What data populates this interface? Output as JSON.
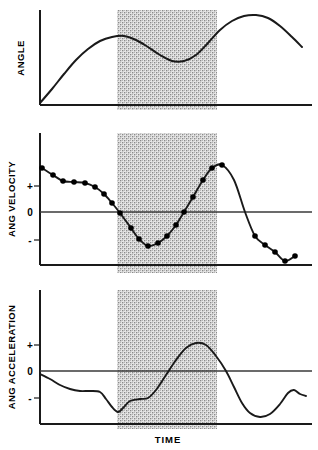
{
  "figure": {
    "title": "",
    "time_axis_label": "TIME",
    "highlight_band": {
      "name": "shaded-interval",
      "x_start": 117,
      "x_end": 217,
      "fill": "#c9c9c9"
    },
    "colors": {
      "curve": "#1a1a1a",
      "axis": "#1a1a1a",
      "marker": "#000000",
      "band": "#c9c9c9",
      "background": "#ffffff"
    }
  },
  "panels": [
    {
      "id": "angle",
      "label": "ANGLE",
      "tick_labels": [],
      "axis_x": 40,
      "axis_top": 10,
      "baseline_y": 105,
      "plot_right": 312
    },
    {
      "id": "ang-velocity",
      "label": "ANG VELOCITY",
      "tick_labels": [
        "+",
        "0",
        "-"
      ],
      "axis_x": 40,
      "axis_top": 133,
      "baseline_y": 265,
      "plot_right": 312,
      "zero_y": 212,
      "plus_y": 186,
      "minus_y": 240
    },
    {
      "id": "ang-acceleration",
      "label": "ANG ACCELERATION",
      "tick_labels": [
        "+",
        "0",
        "-"
      ],
      "axis_x": 40,
      "axis_top": 290,
      "baseline_y": 424,
      "plot_right": 312,
      "zero_y": 371,
      "plus_y": 345,
      "minus_y": 398
    }
  ],
  "chart_data": {
    "type": "line",
    "title": "",
    "xlabel": "TIME",
    "ylabel": "",
    "grid": false,
    "legend": "none",
    "shaded_region": {
      "x_start_frac": 0.283,
      "x_end_frac": 0.651
    },
    "series": [
      {
        "name": "ANGLE",
        "panel": "angle",
        "ylabel": "ANGLE",
        "ytick_labels": [],
        "markers": false,
        "points": [
          [
            40,
            103
          ],
          [
            52,
            89
          ],
          [
            64,
            74
          ],
          [
            76,
            60
          ],
          [
            88,
            49
          ],
          [
            100,
            41
          ],
          [
            112,
            37
          ],
          [
            124,
            36
          ],
          [
            136,
            40
          ],
          [
            148,
            47
          ],
          [
            160,
            55
          ],
          [
            172,
            61
          ],
          [
            184,
            61
          ],
          [
            196,
            55
          ],
          [
            208,
            43
          ],
          [
            220,
            30
          ],
          [
            232,
            21
          ],
          [
            244,
            16
          ],
          [
            256,
            15
          ],
          [
            268,
            18
          ],
          [
            280,
            26
          ],
          [
            292,
            37
          ],
          [
            302,
            47
          ]
        ]
      },
      {
        "name": "ANG VELOCITY",
        "panel": "ang-velocity",
        "ylabel": "ANG VELOCITY",
        "ytick_labels": [
          "+",
          "0",
          "-"
        ],
        "markers": true,
        "points": [
          [
            42,
            168
          ],
          [
            53,
            175
          ],
          [
            63,
            181
          ],
          [
            74,
            182
          ],
          [
            85,
            183
          ],
          [
            95,
            187
          ],
          [
            104,
            194
          ],
          [
            112,
            203
          ],
          [
            120,
            213
          ],
          [
            131,
            228
          ],
          [
            139,
            239
          ],
          [
            148,
            246
          ],
          [
            158,
            243
          ],
          [
            167,
            236
          ],
          [
            176,
            225
          ],
          [
            184,
            212
          ],
          [
            193,
            197
          ],
          [
            203,
            180
          ],
          [
            212,
            168
          ],
          [
            222,
            165
          ],
          [
            234,
            180
          ],
          [
            245,
            212
          ],
          [
            255,
            236
          ],
          [
            265,
            245
          ],
          [
            275,
            252
          ],
          [
            285,
            261
          ],
          [
            295,
            256
          ]
        ],
        "marker_points": [
          [
            42,
            168
          ],
          [
            53,
            175
          ],
          [
            63,
            181
          ],
          [
            74,
            182
          ],
          [
            85,
            183
          ],
          [
            95,
            187
          ],
          [
            104,
            194
          ],
          [
            112,
            203
          ],
          [
            120,
            213
          ],
          [
            131,
            228
          ],
          [
            139,
            239
          ],
          [
            148,
            246
          ],
          [
            158,
            243
          ],
          [
            167,
            236
          ],
          [
            176,
            225
          ],
          [
            184,
            212
          ],
          [
            193,
            197
          ],
          [
            203,
            180
          ],
          [
            212,
            168
          ],
          [
            222,
            165
          ],
          [
            255,
            236
          ],
          [
            265,
            245
          ],
          [
            275,
            252
          ],
          [
            285,
            261
          ],
          [
            295,
            256
          ]
        ]
      },
      {
        "name": "ANG ACCELERATION",
        "panel": "ang-acceleration",
        "ylabel": "ANG ACCELERATION",
        "ytick_labels": [
          "+",
          "0",
          "-"
        ],
        "markers": false,
        "points": [
          [
            40,
            374
          ],
          [
            50,
            379
          ],
          [
            60,
            385
          ],
          [
            70,
            389
          ],
          [
            80,
            391
          ],
          [
            90,
            391
          ],
          [
            100,
            392
          ],
          [
            106,
            399
          ],
          [
            112,
            407
          ],
          [
            118,
            412
          ],
          [
            123,
            408
          ],
          [
            130,
            401
          ],
          [
            140,
            399
          ],
          [
            148,
            398
          ],
          [
            156,
            390
          ],
          [
            166,
            375
          ],
          [
            176,
            360
          ],
          [
            186,
            348
          ],
          [
            196,
            343
          ],
          [
            206,
            345
          ],
          [
            216,
            356
          ],
          [
            226,
            371
          ],
          [
            234,
            387
          ],
          [
            242,
            403
          ],
          [
            250,
            413
          ],
          [
            260,
            417
          ],
          [
            270,
            414
          ],
          [
            280,
            404
          ],
          [
            288,
            393
          ],
          [
            294,
            390
          ],
          [
            300,
            394
          ],
          [
            306,
            396
          ]
        ]
      }
    ]
  }
}
